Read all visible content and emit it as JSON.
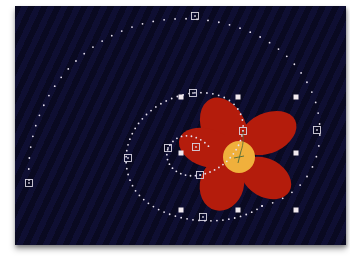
{
  "canvas": {
    "background": "#0d0d2e",
    "offset": [
      15,
      6
    ],
    "size": [
      331,
      239
    ]
  },
  "flower": {
    "petal_color": "#b41c0c",
    "center_color": "#f0b03c",
    "center": [
      239,
      157
    ],
    "center_radius": 16,
    "petals": [
      {
        "name": "top",
        "cx": 224,
        "cy": 128,
        "rx": 22,
        "ry": 32,
        "rotate": -25
      },
      {
        "name": "right",
        "cx": 268,
        "cy": 133,
        "rx": 30,
        "ry": 20,
        "rotate": -25
      },
      {
        "name": "bottom-right",
        "cx": 266,
        "cy": 178,
        "rx": 27,
        "ry": 19,
        "rotate": 30
      },
      {
        "name": "bottom-left",
        "cx": 222,
        "cy": 184,
        "rx": 22,
        "ry": 27,
        "rotate": 15
      },
      {
        "name": "left",
        "cx": 208,
        "cy": 148,
        "rx": 30,
        "ry": 19,
        "rotate": 18
      }
    ]
  },
  "motion_paths": [
    {
      "name": "outer-spiral",
      "d": "M 29 180 C 25 110, 70 40, 150 22 C 210 10, 290 30, 315 100 C 330 150, 310 195, 262 206",
      "dot_spacing": 11
    },
    {
      "name": "middle-loop",
      "d": "M 262 206 C 230 230, 160 225, 135 190 C 110 150, 140 100, 193 93 C 230 90, 245 110, 243 131",
      "dot_spacing": 6
    },
    {
      "name": "inner-loop",
      "d": "M 243 131 C 240 150, 225 170, 200 175 C 175 180, 160 160, 170 145 C 180 130, 200 135, 210 148",
      "dot_spacing": 5
    }
  ],
  "keyframes": [
    {
      "x": 195,
      "y": 16
    },
    {
      "x": 29,
      "y": 183
    },
    {
      "x": 128,
      "y": 158
    },
    {
      "x": 193,
      "y": 93
    },
    {
      "x": 317,
      "y": 130
    },
    {
      "x": 243,
      "y": 131
    },
    {
      "x": 168,
      "y": 148
    },
    {
      "x": 196,
      "y": 147
    },
    {
      "x": 200,
      "y": 175
    },
    {
      "x": 203,
      "y": 217
    }
  ],
  "selection_handles": [
    {
      "x": 181,
      "y": 97
    },
    {
      "x": 238,
      "y": 97
    },
    {
      "x": 296,
      "y": 97
    },
    {
      "x": 181,
      "y": 153
    },
    {
      "x": 296,
      "y": 153
    },
    {
      "x": 181,
      "y": 210
    },
    {
      "x": 238,
      "y": 210
    },
    {
      "x": 296,
      "y": 210
    }
  ],
  "registration_point": {
    "x": 239,
    "y": 157,
    "color": "#4c6b3a"
  }
}
